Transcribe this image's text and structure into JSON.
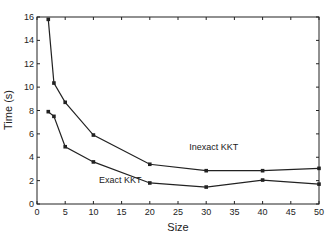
{
  "chart_data": {
    "type": "line",
    "title": "",
    "xlabel": "Size",
    "ylabel": "Time (s)",
    "xlim": [
      0,
      50
    ],
    "ylim": [
      0,
      16
    ],
    "xticks": [
      0,
      5,
      10,
      15,
      20,
      25,
      30,
      35,
      40,
      45,
      50
    ],
    "yticks": [
      0,
      2,
      4,
      6,
      8,
      10,
      12,
      14,
      16
    ],
    "grid": false,
    "legend": "inline labels",
    "series": [
      {
        "name": "Inexact KKT",
        "x": [
          2,
          3,
          5,
          10,
          20,
          30,
          40,
          50
        ],
        "values": [
          15.8,
          10.35,
          8.7,
          5.9,
          3.4,
          2.85,
          2.85,
          3.05
        ],
        "label_pos": [
          27,
          4.6
        ]
      },
      {
        "name": "Exact KKT",
        "x": [
          2,
          3,
          5,
          10,
          20,
          30,
          40,
          50
        ],
        "values": [
          7.9,
          7.5,
          4.9,
          3.6,
          1.8,
          1.45,
          2.05,
          1.7
        ],
        "label_pos": [
          11,
          1.8
        ]
      }
    ],
    "marker": "square",
    "line_color": "#222222"
  }
}
